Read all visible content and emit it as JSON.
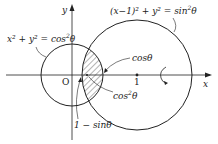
{
  "diagram": {
    "type": "geometry",
    "colors": {
      "stroke": "#222222",
      "hatch": "#444444",
      "background": "#ffffff"
    },
    "axes": {
      "x_label": "x",
      "y_label": "y",
      "origin_label": "O",
      "tick_1_label": "1"
    },
    "circles": [
      {
        "name": "small-circle",
        "equation_lhs": "x² + y² = cos",
        "equation_sup": "2",
        "equation_rhs": "θ",
        "center": [
          0,
          0
        ],
        "radius": "cosθ"
      },
      {
        "name": "large-circle",
        "equation_lhs": "(x−1)² + y² = sin",
        "equation_sup": "2",
        "equation_rhs": "θ",
        "center": [
          1,
          0
        ],
        "radius": "sinθ"
      }
    ],
    "annotations": {
      "cos_theta": "cosθ",
      "cos2_theta_base": "cos",
      "cos2_theta_sup": "2",
      "cos2_theta_end": "θ",
      "one_minus_sin_theta": "1 − sinθ"
    },
    "rotation_arrow": "rotation about x-axis"
  }
}
